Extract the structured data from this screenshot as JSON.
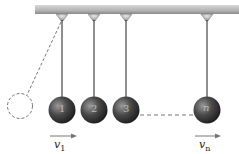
{
  "diagram": {
    "ceiling": {
      "color_top": "#9a9a9a",
      "color_bottom": "#dcdcdc"
    },
    "balls": [
      {
        "label": "1",
        "cx": 62
      },
      {
        "label": "2",
        "cx": 94
      },
      {
        "label": "3",
        "cx": 126
      },
      {
        "label": "n",
        "cx": 207
      }
    ],
    "ball_color": "#3a3a3a",
    "displaced_ball": {
      "style": "dashed",
      "cx": 20,
      "cy": 106
    },
    "velocity_labels": [
      {
        "symbol": "v",
        "sub": "1"
      },
      {
        "symbol": "v",
        "sub": "n"
      }
    ]
  }
}
